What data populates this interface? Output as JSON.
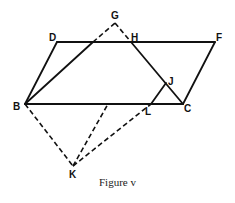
{
  "caption": "Figure v",
  "points": {
    "D": {
      "label": "D",
      "x": 57,
      "y": 42
    },
    "F": {
      "label": "F",
      "x": 215,
      "y": 42
    },
    "B": {
      "label": "B",
      "x": 25,
      "y": 104
    },
    "C": {
      "label": "C",
      "x": 183,
      "y": 104
    },
    "G": {
      "label": "G",
      "x": 115,
      "y": 23
    },
    "H": {
      "label": "H",
      "x": 131,
      "y": 42
    },
    "J": {
      "label": "J",
      "x": 166,
      "y": 83
    },
    "L": {
      "label": "L",
      "x": 151,
      "y": 104
    },
    "K": {
      "label": "K",
      "x": 73,
      "y": 166
    }
  },
  "segments": {
    "solid": [
      "DF",
      "BC",
      "BD",
      "FC",
      "BG(to DF)",
      "HC",
      "LJ"
    ],
    "dashed": [
      "BG(above DF)",
      "GH",
      "BK",
      "KL",
      "K to BC"
    ]
  }
}
